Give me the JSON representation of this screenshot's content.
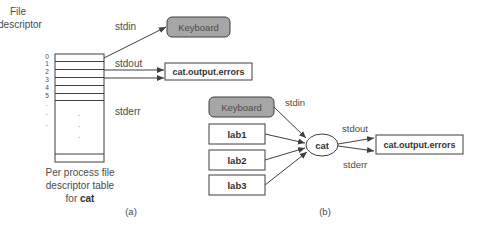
{
  "panel_a": {
    "title_line1": "File",
    "title_line2": "descriptor",
    "fd_numbers": [
      "0",
      "1",
      "2",
      "3",
      "4",
      "5",
      ".",
      ".",
      "."
    ],
    "inner_dots": [
      ".",
      ".",
      "."
    ],
    "stdin_label": "stdin",
    "stdout_label": "stdout",
    "stderr_label": "stderr",
    "keyboard_label": "Keyboard",
    "output_label": "cat.output.errors",
    "caption_line1": "Per process file",
    "caption_line2": "descriptor table",
    "caption_line3_prefix": "for ",
    "caption_line3_bold": "cat",
    "panel_label": "(a)"
  },
  "panel_b": {
    "keyboard_label": "Keyboard",
    "inputs": [
      "lab1",
      "lab2",
      "lab3"
    ],
    "process_label": "cat",
    "stdin_label": "stdin",
    "stdout_label": "stdout",
    "stderr_label": "stderr",
    "output_label": "cat.output.errors",
    "panel_label": "(b)"
  },
  "colors": {
    "keyboard_fill": "#a6a6a6",
    "stroke": "#3f3f3f",
    "text": "#4a4a4a"
  }
}
